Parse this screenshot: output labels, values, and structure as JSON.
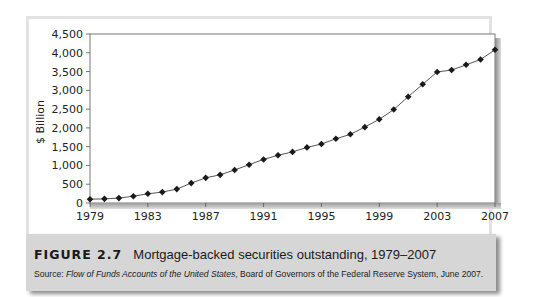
{
  "figure": {
    "label": "FIGURE 2.7",
    "title": "Mortgage-backed securities outstanding, 1979–2007",
    "source_prefix": "Source: ",
    "source_italic": "Flow of Funds Accounts of the United States",
    "source_rest": ", Board of Governors of the Federal Reserve System, June 2007."
  },
  "chart_data": {
    "type": "line",
    "title": "Mortgage-backed securities outstanding, 1979–2007",
    "xlabel": "",
    "ylabel": "$ Billion",
    "x": [
      1979,
      1980,
      1981,
      1982,
      1983,
      1984,
      1985,
      1986,
      1987,
      1988,
      1989,
      1990,
      1991,
      1992,
      1993,
      1994,
      1995,
      1996,
      1997,
      1998,
      1999,
      2000,
      2001,
      2002,
      2003,
      2004,
      2005,
      2006,
      2007
    ],
    "values": [
      100,
      110,
      130,
      180,
      245,
      290,
      370,
      530,
      670,
      750,
      880,
      1020,
      1160,
      1270,
      1360,
      1480,
      1570,
      1710,
      1830,
      2020,
      2230,
      2490,
      2830,
      3160,
      3490,
      3540,
      3680,
      3820,
      4080
    ],
    "xticks": [
      "1979",
      "1983",
      "1987",
      "1991",
      "1995",
      "1999",
      "2003",
      "2007"
    ],
    "yticks": [
      "0",
      "500",
      "1,000",
      "1,500",
      "2,000",
      "2,500",
      "3,000",
      "3,500",
      "4,000",
      "4,500"
    ],
    "ylim": [
      0,
      4500
    ],
    "xlim": [
      1979,
      2007
    ],
    "grid": false,
    "legend": null,
    "marker": "diamond",
    "line_color": "#555555",
    "marker_color": "#1a1a1a"
  }
}
